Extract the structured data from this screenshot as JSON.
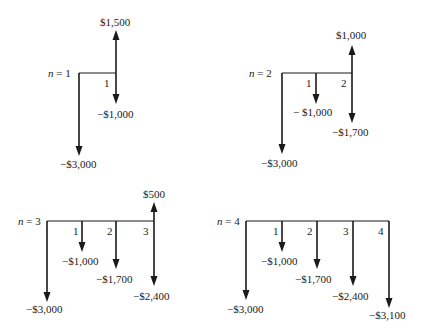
{
  "figure": {
    "diagrams": [
      {
        "n_label": "n = 1",
        "n_var": "n",
        "n_value": "1",
        "periods": [
          "1"
        ],
        "flows": [
          {
            "period": 0,
            "amount": -3000,
            "label": "−$3,000"
          },
          {
            "period": 1,
            "amount": -1000,
            "label": "−$1,000"
          },
          {
            "period": 1,
            "amount": 1500,
            "label": "$1,500"
          }
        ]
      },
      {
        "n_label": "n = 2",
        "n_var": "n",
        "n_value": "2",
        "periods": [
          "1",
          "2"
        ],
        "flows": [
          {
            "period": 0,
            "amount": -3000,
            "label": "−$3,000"
          },
          {
            "period": 1,
            "amount": -1000,
            "label": "− $1,000"
          },
          {
            "period": 2,
            "amount": -1700,
            "label": "−$1,700"
          },
          {
            "period": 2,
            "amount": 1000,
            "label": "$1,000"
          }
        ]
      },
      {
        "n_label": "n = 3",
        "n_var": "n",
        "n_value": "3",
        "periods": [
          "1",
          "2",
          "3"
        ],
        "flows": [
          {
            "period": 0,
            "amount": -3000,
            "label": "−$3,000"
          },
          {
            "period": 1,
            "amount": -1000,
            "label": "−$1,000"
          },
          {
            "period": 2,
            "amount": -1700,
            "label": "−$1,700"
          },
          {
            "period": 3,
            "amount": -2400,
            "label": "−$2,400"
          },
          {
            "period": 3,
            "amount": 500,
            "label": "$500"
          }
        ]
      },
      {
        "n_label": "n = 4",
        "n_var": "n",
        "n_value": "4",
        "periods": [
          "1",
          "2",
          "3",
          "4"
        ],
        "flows": [
          {
            "period": 0,
            "amount": -3000,
            "label": "−$3,000"
          },
          {
            "period": 1,
            "amount": -1000,
            "label": "−$1,000"
          },
          {
            "period": 2,
            "amount": -1700,
            "label": "−$1,700"
          },
          {
            "period": 3,
            "amount": -2400,
            "label": "−$2,400"
          },
          {
            "period": 4,
            "amount": -3100,
            "label": "−$3,100"
          }
        ]
      }
    ]
  }
}
